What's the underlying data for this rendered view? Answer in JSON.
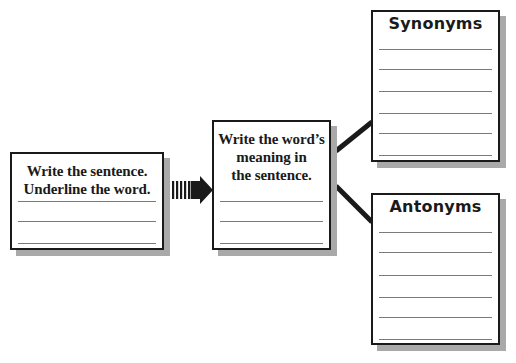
{
  "diagram": {
    "boxes": {
      "sentence": {
        "title_lines": [
          "Write the sentence.",
          "Underline the word."
        ],
        "blank_lines": 3
      },
      "meaning": {
        "title_lines": [
          "Write the word’s",
          "meaning in",
          "the sentence."
        ],
        "blank_lines": 3
      },
      "synonyms": {
        "title": "Synonyms",
        "blank_lines": 6
      },
      "antonyms": {
        "title": "Antonyms",
        "blank_lines": 6
      }
    },
    "arrow": {
      "icon": "striped-right-arrow-icon",
      "from": "sentence",
      "to": "meaning"
    },
    "connectors": [
      {
        "from": "meaning",
        "to": "synonyms"
      },
      {
        "from": "meaning",
        "to": "antonyms"
      }
    ],
    "colors": {
      "border": "#1a1a1a",
      "shadow": "#a9a9a9",
      "rule": "#7a7a7a",
      "background": "#ffffff"
    }
  }
}
